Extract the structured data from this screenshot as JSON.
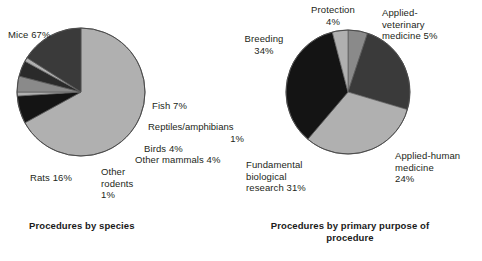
{
  "figure": {
    "background": "#ffffff",
    "text_color": "#231f20"
  },
  "palette": {
    "light_gray": "#b0b0b0",
    "mid_gray": "#8a8a8a",
    "dark_gray": "#3a3a3a",
    "black": "#141414",
    "outline": "#5a5a5a"
  },
  "charts": {
    "species": {
      "caption": "Procedures by species",
      "labels": {
        "mice": "Mice 67%",
        "fish": "Fish 7%",
        "reptiles_name": "Reptiles/amphibians",
        "reptiles_pct": "1%",
        "birds": "Birds 4%",
        "other_mammals": "Other mammals 4%",
        "other_rodents": "Other\nrodents\n1%",
        "rats": "Rats 16%"
      }
    },
    "purpose": {
      "caption": "Procedures by primary\npurpose of procedure",
      "labels": {
        "protection": "Protection\n4%",
        "applied_vet": "Applied-\nveterinary\nmedicine 5%",
        "applied_human": "Applied-human\nmedicine\n24%",
        "fundamental": "Fundamental\nbiological\nresearch 31%",
        "breeding": "Breeding\n34%"
      }
    }
  },
  "chart_data": [
    {
      "type": "pie",
      "title": "Procedures by species",
      "categories": [
        "Mice",
        "Fish",
        "Reptiles/amphibians",
        "Birds",
        "Other mammals",
        "Other rodents",
        "Rats"
      ],
      "values": [
        67,
        7,
        1,
        4,
        4,
        1,
        16
      ],
      "value_labels": [
        "67%",
        "7%",
        "1%",
        "4%",
        "4%",
        "1%",
        "16%"
      ],
      "unit": "percent",
      "colors": [
        "#b0b0b0",
        "#141414",
        "#b0b0b0",
        "#8a8a8a",
        "#2a2a2a",
        "#b0b0b0",
        "#3a3a3a"
      ],
      "start_angle_deg": 0,
      "direction": "clockwise",
      "legend": "none",
      "grid": false
    },
    {
      "type": "pie",
      "title": "Procedures by primary purpose of procedure",
      "categories": [
        "Applied-veterinary medicine",
        "Applied-human medicine",
        "Fundamental biological research",
        "Breeding",
        "Protection"
      ],
      "values": [
        5,
        24,
        31,
        34,
        4
      ],
      "value_labels": [
        "5%",
        "24%",
        "31%",
        "34%",
        "4%"
      ],
      "unit": "percent",
      "colors": [
        "#8a8a8a",
        "#3a3a3a",
        "#b0b0b0",
        "#141414",
        "#b0b0b0"
      ],
      "start_angle_deg": 0,
      "direction": "clockwise",
      "legend": "none",
      "grid": false
    }
  ]
}
